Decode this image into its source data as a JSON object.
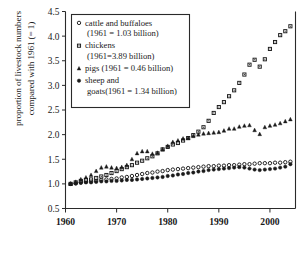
{
  "chart_data": {
    "type": "scatter",
    "title": "",
    "xlabel": "",
    "ylabel": "proportion of livestock numbers compared with 1961 (= 1)",
    "xlim": [
      1960,
      2005
    ],
    "ylim": [
      0.5,
      4.5
    ],
    "xticks": [
      1960,
      1970,
      1980,
      1990,
      2000
    ],
    "yticks": [
      0.5,
      1.0,
      1.5,
      2.0,
      2.5,
      3.0,
      3.5,
      4.0,
      4.5
    ],
    "grid": false,
    "legend_position": "top-left",
    "x": [
      1961,
      1962,
      1963,
      1964,
      1965,
      1966,
      1967,
      1968,
      1969,
      1970,
      1971,
      1972,
      1973,
      1974,
      1975,
      1976,
      1977,
      1978,
      1979,
      1980,
      1981,
      1982,
      1983,
      1984,
      1985,
      1986,
      1987,
      1988,
      1989,
      1990,
      1991,
      1992,
      1993,
      1994,
      1995,
      1996,
      1997,
      1998,
      1999,
      2000,
      2001,
      2002,
      2003,
      2004
    ],
    "series": [
      {
        "name": "cattle and buffaloes",
        "marker": "open-circle",
        "baseline_label": "(1961 = 1.03 billion)",
        "values": [
          1.0,
          1.01,
          1.03,
          1.04,
          1.05,
          1.06,
          1.08,
          1.09,
          1.1,
          1.11,
          1.13,
          1.14,
          1.16,
          1.18,
          1.2,
          1.22,
          1.23,
          1.25,
          1.26,
          1.28,
          1.29,
          1.3,
          1.31,
          1.32,
          1.33,
          1.34,
          1.35,
          1.36,
          1.36,
          1.37,
          1.37,
          1.38,
          1.38,
          1.39,
          1.4,
          1.4,
          1.41,
          1.42,
          1.42,
          1.42,
          1.43,
          1.43,
          1.44,
          1.45
        ]
      },
      {
        "name": "chickens",
        "marker": "open-square",
        "baseline_label": "(1961=3.89 billion)",
        "values": [
          1.0,
          1.03,
          1.06,
          1.08,
          1.09,
          1.12,
          1.15,
          1.18,
          1.22,
          1.26,
          1.3,
          1.34,
          1.38,
          1.43,
          1.47,
          1.52,
          1.56,
          1.62,
          1.7,
          1.75,
          1.8,
          1.83,
          1.88,
          1.93,
          1.99,
          2.06,
          2.15,
          2.28,
          2.44,
          2.56,
          2.66,
          2.78,
          2.9,
          3.05,
          3.22,
          3.42,
          3.52,
          3.38,
          3.53,
          3.74,
          3.88,
          4.02,
          4.1,
          4.2
        ]
      },
      {
        "name": "pigs",
        "marker": "filled-triangle",
        "baseline_label": "(1961 = 0.46 billion)",
        "values": [
          1.0,
          1.04,
          1.09,
          1.13,
          1.18,
          1.26,
          1.33,
          1.35,
          1.33,
          1.32,
          1.34,
          1.38,
          1.5,
          1.62,
          1.66,
          1.66,
          1.61,
          1.63,
          1.7,
          1.77,
          1.85,
          1.88,
          1.92,
          1.93,
          1.97,
          2.0,
          2.02,
          2.03,
          2.04,
          2.05,
          2.08,
          2.12,
          2.12,
          2.16,
          2.18,
          2.19,
          2.09,
          2.01,
          2.15,
          2.18,
          2.2,
          2.23,
          2.27,
          2.31
        ]
      },
      {
        "name": "sheep and goats",
        "marker": "filled-circle",
        "baseline_label": "(1961 = 1.34 billion)",
        "values": [
          1.0,
          1.01,
          1.02,
          1.03,
          1.03,
          1.04,
          1.05,
          1.05,
          1.06,
          1.06,
          1.07,
          1.08,
          1.08,
          1.09,
          1.1,
          1.11,
          1.12,
          1.13,
          1.14,
          1.16,
          1.17,
          1.19,
          1.2,
          1.22,
          1.23,
          1.25,
          1.26,
          1.28,
          1.29,
          1.3,
          1.31,
          1.32,
          1.33,
          1.34,
          1.33,
          1.31,
          1.29,
          1.28,
          1.29,
          1.3,
          1.31,
          1.33,
          1.35,
          1.4
        ]
      }
    ]
  },
  "legend": {
    "entries": [
      {
        "label": "cattle and buffaloes",
        "sub": "(1961 = 1.03 billion)",
        "marker": "open-circle"
      },
      {
        "label": "chickens",
        "sub": "(1961=3.89 billion)",
        "marker": "open-square"
      },
      {
        "label": "pigs (1961 = 0.46 billion)",
        "sub": "",
        "marker": "filled-triangle"
      },
      {
        "label": "sheep and",
        "sub": "goats(1961 = 1.34 billion)",
        "marker": "filled-circle"
      }
    ]
  },
  "axes": {
    "ylabel": "proportion of livestock numbers compared with 1961 (= 1)",
    "ylabel_line1": "proportion of livestock numbers",
    "ylabel_line2": "compared with 1961 (= 1)"
  }
}
